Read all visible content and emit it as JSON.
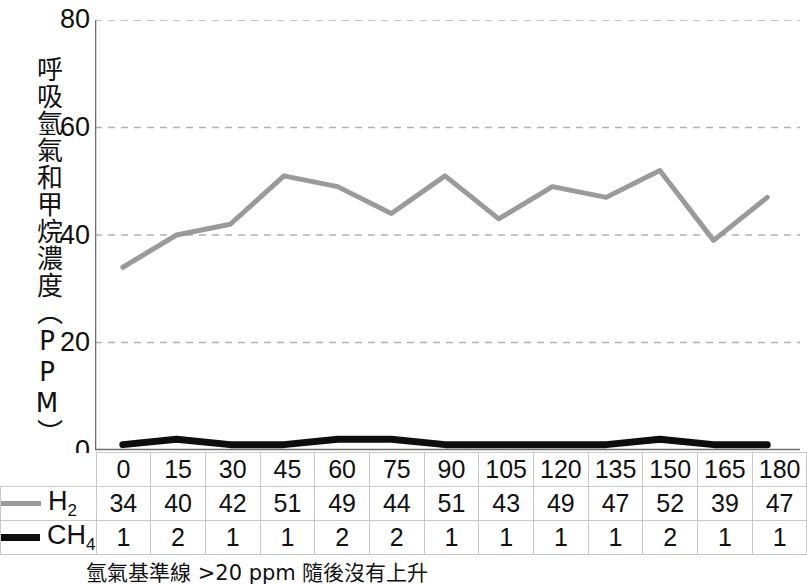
{
  "chart_data": {
    "type": "line",
    "title": "",
    "xlabel": "",
    "ylabel": "呼吸氫氣和甲烷濃度（PPM）",
    "categories": [
      "0",
      "15",
      "30",
      "45",
      "60",
      "75",
      "90",
      "105",
      "120",
      "135",
      "150",
      "165",
      "180"
    ],
    "series": [
      {
        "name": "H₂",
        "label_main": "H",
        "label_sub": "2",
        "color": "#9a9a9a",
        "width": 5,
        "values": [
          34,
          40,
          42,
          51,
          49,
          44,
          51,
          43,
          49,
          47,
          52,
          39,
          47
        ]
      },
      {
        "name": "CH₄",
        "label_main": "CH",
        "label_sub": "4",
        "color": "#0d0d0d",
        "width": 7,
        "values": [
          1,
          2,
          1,
          1,
          2,
          2,
          1,
          1,
          1,
          1,
          2,
          1,
          1
        ]
      }
    ],
    "ylim": [
      0,
      80
    ],
    "yticks": [
      "0",
      "20",
      "40",
      "60",
      "80"
    ],
    "ytick_values": [
      0,
      20,
      40,
      60,
      80
    ],
    "grid": "horizontal-dashed",
    "grid_color": "#b3b3b3",
    "axis_color": "#6e6e6e",
    "legend_position": "row-header-left",
    "annotation": "氫氣基準線 >20 ppm 隨後沒有上升"
  },
  "table": {
    "header_blank": "",
    "columns": [
      "0",
      "15",
      "30",
      "45",
      "60",
      "75",
      "90",
      "105",
      "120",
      "135",
      "150",
      "165",
      "180"
    ],
    "rows": [
      {
        "label_main": "H",
        "label_sub": "2",
        "values": [
          "34",
          "40",
          "42",
          "51",
          "49",
          "44",
          "51",
          "43",
          "49",
          "47",
          "52",
          "39",
          "47"
        ]
      },
      {
        "label_main": "CH",
        "label_sub": "4",
        "values": [
          "1",
          "2",
          "1",
          "1",
          "2",
          "2",
          "1",
          "1",
          "1",
          "1",
          "2",
          "1",
          "1"
        ]
      }
    ]
  },
  "axis": {
    "y_title": "呼吸氫氣和甲烷濃度（PPM）",
    "ticks": [
      "80",
      "60",
      "40",
      "20",
      "0"
    ]
  },
  "footnote": {
    "text": "氫氣基準線 >20 ppm 隨後沒有上升"
  }
}
